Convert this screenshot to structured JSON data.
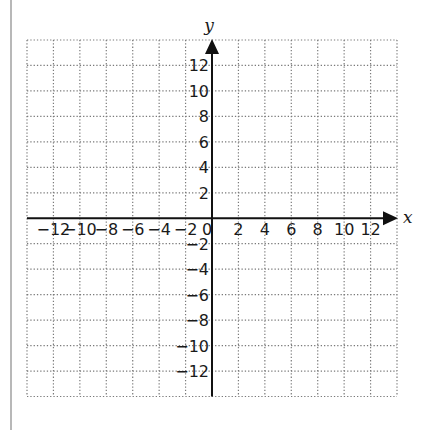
{
  "chart_data": {
    "type": "coordinate-grid",
    "title": "",
    "xlabel": "x",
    "ylabel": "y",
    "xlim": [
      -14,
      14
    ],
    "ylim": [
      -14,
      14
    ],
    "grid": true,
    "grid_step": 2,
    "grid_style": "dotted",
    "x_tick_labels": [
      "−12",
      "−10",
      "−8",
      "−6",
      "−4",
      "−2",
      "0",
      "2",
      "4",
      "6",
      "8",
      "10",
      "12"
    ],
    "x_tick_values": [
      -12,
      -10,
      -8,
      -6,
      -4,
      -2,
      0,
      2,
      4,
      6,
      8,
      10,
      12
    ],
    "y_tick_labels": [
      "12",
      "10",
      "8",
      "6",
      "4",
      "2",
      "−2",
      "−4",
      "−6",
      "−8",
      "−10",
      "−12"
    ],
    "y_tick_values": [
      12,
      10,
      8,
      6,
      4,
      2,
      -2,
      -4,
      -6,
      -8,
      -10,
      -12
    ],
    "arrows": [
      "positive-x",
      "positive-y"
    ],
    "points": []
  },
  "axes": {
    "x_name": "x",
    "y_name": "y",
    "origin_label": "0"
  },
  "colors": {
    "axis": "#111111",
    "grid": "#7a7a7a",
    "text": "#1a1a1a",
    "page_rule": "#b8b8b8"
  }
}
